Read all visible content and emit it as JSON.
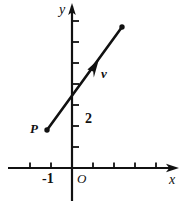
{
  "figure": {
    "width": 185,
    "height": 204,
    "background": "#ffffff",
    "ink_color": "#111111"
  },
  "axes": {
    "x": {
      "label": "x",
      "label_x": 170,
      "label_y": 176,
      "line_y": 168,
      "start_x": 8,
      "end_x": 178,
      "arrow": "right"
    },
    "y": {
      "label": "y",
      "label_x": 60,
      "label_y": 4,
      "line_x": 72,
      "start_y": 6,
      "end_y": 201,
      "arrow": "up"
    },
    "origin": {
      "label": "O",
      "label_x": 77,
      "label_y": 174,
      "x": 72,
      "y": 168
    }
  },
  "ticks": {
    "spacing": 21,
    "x_positions": [
      30,
      51,
      93,
      114,
      135,
      156
    ],
    "y_positions": [
      21,
      42,
      63,
      84,
      105,
      126,
      147
    ],
    "labels": [
      {
        "text": "-1",
        "x": 43,
        "y": 174,
        "axis": "x"
      },
      {
        "text": "2",
        "x": 85,
        "y": 114,
        "axis": "y"
      }
    ]
  },
  "segment": {
    "name": "directed-line-through-P",
    "from": {
      "label": "P",
      "x": 47,
      "y": 130,
      "label_x": 30,
      "label_y": 124
    },
    "to": {
      "label": "",
      "x": 122,
      "y": 27
    },
    "stroke_width": 2.6,
    "endpoint_dot_radius": 2.6
  },
  "vector": {
    "label": "v",
    "label_x": 101,
    "label_y": 70,
    "arrow_tip_x": 97,
    "arrow_tip_y": 62,
    "arrow_base_x": 84,
    "arrow_base_y": 80
  }
}
